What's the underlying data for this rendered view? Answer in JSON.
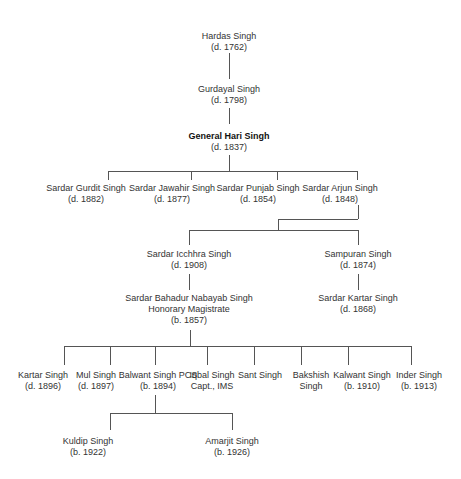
{
  "generations": {
    "g1": [
      {
        "name": "Hardas Singh",
        "note": "(d. 1762)"
      }
    ],
    "g2": [
      {
        "name": "Gurdayal Singh",
        "note": "(d. 1798)"
      }
    ],
    "g3": [
      {
        "name": "General Hari Singh",
        "note": "(d. 1837)",
        "bold": true
      }
    ],
    "g4": [
      {
        "name": "Sardar Gurdit Singh",
        "note": "(d. 1882)"
      },
      {
        "name": "Sardar Jawahir Singh",
        "note": "(d. 1877)"
      },
      {
        "name": "Sardar Punjab Singh",
        "note": "(d. 1854)"
      },
      {
        "name": "Sardar Arjun Singh",
        "note": "(d. 1848)"
      }
    ],
    "g5": [
      {
        "name": "Sardar Icchhra Singh",
        "note": "(d. 1908)"
      },
      {
        "name": "Sampuran Singh",
        "note": "(d. 1874)"
      }
    ],
    "g6": [
      {
        "name": "Sardar Bahadur Nabayab Singh",
        "title": "Honorary Magistrate",
        "note": "(b. 1857)"
      },
      {
        "name": "Sardar Kartar Singh",
        "note": "(d. 1868)"
      }
    ],
    "g7": [
      {
        "name": "Kartar Singh",
        "note": "(d. 1896)"
      },
      {
        "name": "Mul Singh",
        "note": "(d. 1897)"
      },
      {
        "name": "Balwant Singh PCS",
        "note": "(b. 1894)"
      },
      {
        "name": "Iqbal Singh",
        "note": "Capt., IMS"
      },
      {
        "name": "Sant Singh",
        "note": ""
      },
      {
        "name": "Bakshish",
        "note": "Singh"
      },
      {
        "name": "Kalwant Singh",
        "note": "(b. 1910)"
      },
      {
        "name": "Inder Singh",
        "note": "(b. 1913)"
      }
    ],
    "g8": [
      {
        "name": "Kuldip Singh",
        "note": "(b. 1922)"
      },
      {
        "name": "Amarjit Singh",
        "note": "(b. 1926)"
      }
    ]
  },
  "colors": {
    "text": "#333333",
    "line": "#555555",
    "background": "#ffffff"
  }
}
